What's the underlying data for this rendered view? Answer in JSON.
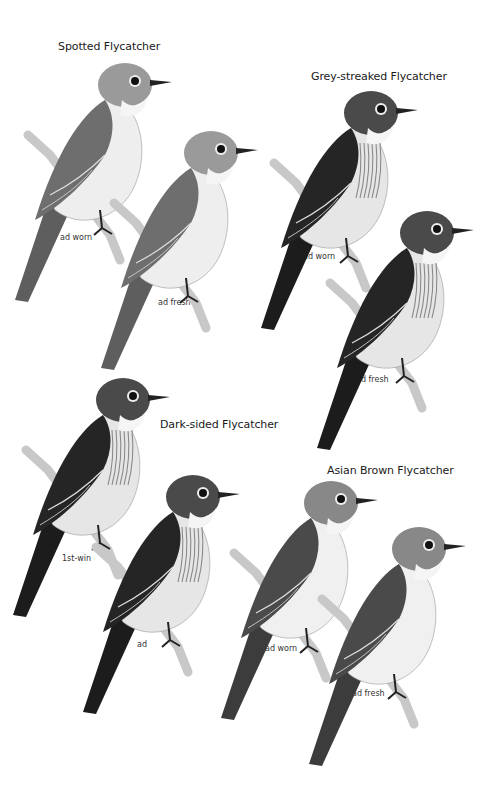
{
  "plate": {
    "species": [
      {
        "name": "Spotted Flycatcher",
        "title_pos": [
          58,
          40
        ],
        "birds": [
          {
            "label": "ad worn",
            "x": 10,
            "y": 60,
            "s": 1.0,
            "tone": "pale",
            "label_pos": [
              60,
              233
            ]
          },
          {
            "label": "ad fresh",
            "x": 96,
            "y": 128,
            "s": 1.0,
            "tone": "pale",
            "label_pos": [
              158,
              298
            ]
          }
        ]
      },
      {
        "name": "Grey-streaked Flycatcher",
        "title_pos": [
          311,
          72
        ],
        "birds": [
          {
            "label": "ad worn",
            "x": 256,
            "y": 88,
            "s": 1.0,
            "tone": "dark",
            "label_pos": [
              303,
              252
            ]
          },
          {
            "label": "ad fresh",
            "x": 312,
            "y": 208,
            "s": 1.0,
            "tone": "dark",
            "label_pos": [
              356,
              375
            ]
          }
        ]
      },
      {
        "name": "Dark-sided Flycatcher",
        "title_pos": [
          160,
          420
        ],
        "birds": [
          {
            "label": "1st-win",
            "x": 8,
            "y": 375,
            "s": 1.0,
            "tone": "dark",
            "label_pos": [
              62,
              554
            ]
          },
          {
            "label": "ad",
            "x": 78,
            "y": 472,
            "s": 1.0,
            "tone": "dark",
            "label_pos": [
              137,
              640
            ]
          }
        ]
      },
      {
        "name": "Asian Brown Flycatcher",
        "title_pos": [
          327,
          465
        ],
        "birds": [
          {
            "label": "ad worn",
            "x": 216,
            "y": 478,
            "s": 1.0,
            "tone": "mid",
            "label_pos": [
              265,
              644
            ]
          },
          {
            "label": "ad fresh",
            "x": 304,
            "y": 524,
            "s": 1.0,
            "tone": "mid",
            "label_pos": [
              352,
              689
            ]
          }
        ]
      }
    ]
  },
  "tones": {
    "pale": {
      "body": "#8c8c8c",
      "wing": "#6e6e6e",
      "belly": "#eeeeee",
      "head": "#9a9a9a",
      "tail": "#5e5e5e"
    },
    "dark": {
      "body": "#3a3a3a",
      "wing": "#252525",
      "belly": "#e6e6e6",
      "head": "#4a4a4a",
      "tail": "#1c1c1c"
    },
    "mid": {
      "body": "#777777",
      "wing": "#4a4a4a",
      "belly": "#f0f0f0",
      "head": "#888888",
      "tail": "#3c3c3c"
    }
  },
  "labels": {
    "spotted_title": "Spotted Flycatcher",
    "spotted_1": "ad worn",
    "spotted_2": "ad fresh",
    "greystreaked_title": "Grey-streaked Flycatcher",
    "greystreaked_1": "ad worn",
    "greystreaked_2": "ad fresh",
    "darksided_title": "Dark-sided Flycatcher",
    "darksided_1": "1st-win",
    "darksided_2": "ad",
    "asianbrown_title": "Asian Brown Flycatcher",
    "asianbrown_1": "ad worn",
    "asianbrown_2": "ad fresh"
  }
}
